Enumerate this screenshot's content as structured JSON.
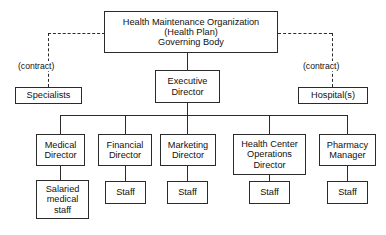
{
  "diagram": {
    "title_text": "Health Maintenance Organization (Health Plan) Governing Body organizational chart",
    "line_color": "#2b2b2b",
    "box_fill": "#ffffff",
    "text_color": "#111111"
  },
  "nodes": {
    "governing_body": {
      "label": "Health Maintenance Organization\n(Health Plan)\nGoverning Body",
      "x": 104,
      "y": 11,
      "w": 174,
      "h": 42
    },
    "executive_director": {
      "label": "Executive\nDirector",
      "x": 155,
      "y": 70,
      "w": 65,
      "h": 33
    },
    "specialists": {
      "label": "Specialists",
      "x": 15,
      "y": 87,
      "w": 67,
      "h": 17
    },
    "hospitals": {
      "label": "Hospital(s)",
      "x": 298,
      "y": 87,
      "w": 70,
      "h": 17
    },
    "medical_director": {
      "label": "Medical\nDirector",
      "x": 36,
      "y": 134,
      "w": 49,
      "h": 32
    },
    "financial_director": {
      "label": "Financial\nDirector",
      "x": 98,
      "y": 134,
      "w": 54,
      "h": 32
    },
    "marketing_director": {
      "label": "Marketing\nDirector",
      "x": 160,
      "y": 134,
      "w": 56,
      "h": 32
    },
    "health_center_operations_director": {
      "label": "Health Center\nOperations\nDirector",
      "x": 233,
      "y": 134,
      "w": 73,
      "h": 41
    },
    "pharmacy_manager": {
      "label": "Pharmacy\nManager",
      "x": 319,
      "y": 134,
      "w": 57,
      "h": 32
    },
    "salaried_medical_staff": {
      "label": "Salaried\nmedical\nstaff",
      "x": 36,
      "y": 180,
      "w": 53,
      "h": 39
    },
    "staff_financial": {
      "label": "Staff",
      "x": 105,
      "y": 181,
      "w": 41,
      "h": 23
    },
    "staff_marketing": {
      "label": "Staff",
      "x": 167,
      "y": 181,
      "w": 41,
      "h": 23
    },
    "staff_health_center": {
      "label": "Staff",
      "x": 249,
      "y": 181,
      "w": 41,
      "h": 23
    },
    "staff_pharmacy": {
      "label": "Staff",
      "x": 327,
      "y": 181,
      "w": 41,
      "h": 23
    }
  },
  "annotations": {
    "contract_left": {
      "label": "(contract)",
      "x": 17,
      "y": 61
    },
    "contract_right": {
      "label": "(contract)",
      "x": 302,
      "y": 61
    }
  },
  "connectors": {
    "solid": [
      {
        "name": "governing-to-exec-vertical",
        "type": "v",
        "x": 187,
        "y": 53,
        "len": 17
      },
      {
        "name": "exec-to-bus-vertical",
        "type": "v",
        "x": 187,
        "y": 103,
        "len": 12
      },
      {
        "name": "directors-bus-horizontal",
        "type": "h",
        "x": 60,
        "y": 115,
        "len": 288
      },
      {
        "name": "bus-to-medical",
        "type": "v",
        "x": 60,
        "y": 115,
        "len": 19
      },
      {
        "name": "bus-to-financial",
        "type": "v",
        "x": 125,
        "y": 115,
        "len": 19
      },
      {
        "name": "bus-to-marketing",
        "type": "v",
        "x": 187,
        "y": 115,
        "len": 19
      },
      {
        "name": "bus-to-health-center",
        "type": "v",
        "x": 269,
        "y": 115,
        "len": 19
      },
      {
        "name": "bus-to-pharmacy",
        "type": "v",
        "x": 347,
        "y": 115,
        "len": 19
      },
      {
        "name": "medical-to-staff",
        "type": "v",
        "x": 60,
        "y": 166,
        "len": 14
      },
      {
        "name": "financial-to-staff",
        "type": "v",
        "x": 125,
        "y": 166,
        "len": 15
      },
      {
        "name": "marketing-to-staff",
        "type": "v",
        "x": 187,
        "y": 166,
        "len": 15
      },
      {
        "name": "health-center-to-staff",
        "type": "v",
        "x": 269,
        "y": 175,
        "len": 6
      },
      {
        "name": "pharmacy-to-staff",
        "type": "v",
        "x": 347,
        "y": 166,
        "len": 15
      }
    ],
    "dashed": [
      {
        "name": "governing-to-specialists-horizontal",
        "type": "h",
        "x": 48,
        "y": 33,
        "len": 56
      },
      {
        "name": "governing-to-specialists-vertical",
        "type": "v",
        "x": 48,
        "y": 33,
        "len": 54
      },
      {
        "name": "governing-to-hospitals-horizontal",
        "type": "h",
        "x": 278,
        "y": 33,
        "len": 54
      },
      {
        "name": "governing-to-hospitals-vertical",
        "type": "v",
        "x": 332,
        "y": 33,
        "len": 54
      }
    ]
  }
}
